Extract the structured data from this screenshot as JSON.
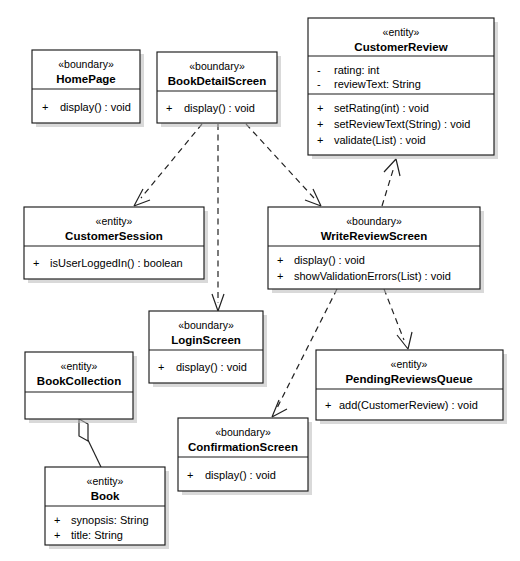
{
  "diagram": {
    "kind": "uml-class-diagram",
    "background_color": "#ffffff",
    "line_color": "#222222",
    "box_fill": "#ffffff",
    "box_border_color": "#1a1a1a",
    "shadow_color": "#b9b9b9"
  },
  "classes": {
    "home_page": {
      "stereotype": "«boundary»",
      "name": "HomePage",
      "attributes": [],
      "operations": [
        {
          "visibility": "+",
          "text": "display() : void"
        }
      ]
    },
    "book_detail_screen": {
      "stereotype": "«boundary»",
      "name": "BookDetailScreen",
      "attributes": [],
      "operations": [
        {
          "visibility": "+",
          "text": "display() : void"
        }
      ]
    },
    "customer_review": {
      "stereotype": "«entity»",
      "name": "CustomerReview",
      "attributes": [
        {
          "visibility": "-",
          "text": "rating:  int"
        },
        {
          "visibility": "-",
          "text": "reviewText:  String"
        }
      ],
      "operations": [
        {
          "visibility": "+",
          "text": "setRating(int) : void"
        },
        {
          "visibility": "+",
          "text": "setReviewText(String) : void"
        },
        {
          "visibility": "+",
          "text": "validate(List) : void"
        }
      ]
    },
    "customer_session": {
      "stereotype": "«entity»",
      "name": "CustomerSession",
      "attributes": [],
      "operations": [
        {
          "visibility": "+",
          "text": "isUserLoggedIn() : boolean"
        }
      ]
    },
    "write_review_screen": {
      "stereotype": "«boundary»",
      "name": "WriteReviewScreen",
      "attributes": [],
      "operations": [
        {
          "visibility": "+",
          "text": "display() : void"
        },
        {
          "visibility": "+",
          "text": "showValidationErrors(List) : void"
        }
      ]
    },
    "login_screen": {
      "stereotype": "«boundary»",
      "name": "LoginScreen",
      "attributes": [],
      "operations": [
        {
          "visibility": "+",
          "text": "display() : void"
        }
      ]
    },
    "book_collection": {
      "stereotype": "«entity»",
      "name": "BookCollection",
      "attributes": [],
      "operations": []
    },
    "book": {
      "stereotype": "«entity»",
      "name": "Book",
      "attributes": [
        {
          "visibility": "+",
          "text": "synopsis:  String"
        },
        {
          "visibility": "+",
          "text": "title:  String"
        }
      ],
      "operations": []
    },
    "pending_reviews_queue": {
      "stereotype": "«entity»",
      "name": "PendingReviewsQueue",
      "attributes": [],
      "operations": [
        {
          "visibility": "+",
          "text": "add(CustomerReview) : void"
        }
      ]
    },
    "confirmation_screen": {
      "stereotype": "«boundary»",
      "name": "ConfirmationScreen",
      "attributes": [],
      "operations": [
        {
          "visibility": "+",
          "text": "display() : void"
        }
      ]
    }
  },
  "relationships": [
    {
      "id": "dep-bookdetail-customersession",
      "from": "BookDetailScreen",
      "to": "CustomerSession",
      "type": "dependency"
    },
    {
      "id": "dep-bookdetail-loginscreen",
      "from": "BookDetailScreen",
      "to": "LoginScreen",
      "type": "dependency"
    },
    {
      "id": "dep-bookdetail-writereviewscreen",
      "from": "BookDetailScreen",
      "to": "WriteReviewScreen",
      "type": "dependency"
    },
    {
      "id": "dep-writereviewscreen-customerreview",
      "from": "WriteReviewScreen",
      "to": "CustomerReview",
      "type": "dependency"
    },
    {
      "id": "dep-writereviewscreen-confirmationscreen",
      "from": "WriteReviewScreen",
      "to": "ConfirmationScreen",
      "type": "dependency"
    },
    {
      "id": "dep-writereviewscreen-pendingreviewsqueue",
      "from": "WriteReviewScreen",
      "to": "PendingReviewsQueue",
      "type": "dependency"
    },
    {
      "id": "agg-bookcollection-book",
      "from": "BookCollection",
      "to": "Book",
      "type": "aggregation"
    }
  ]
}
